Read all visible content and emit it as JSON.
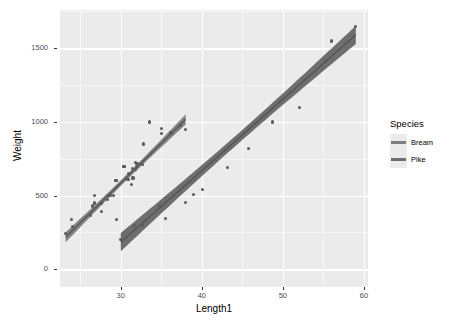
{
  "chart_data": {
    "type": "scatter",
    "title": "",
    "xlabel": "Length1",
    "ylabel": "Weight",
    "xlim": [
      22.5,
      60.5
    ],
    "ylim": [
      -120,
      1760
    ],
    "xticks": [
      30,
      40,
      50,
      60
    ],
    "yticks": [
      0,
      500,
      1000,
      1500
    ],
    "xticklabels": [
      "30",
      "40",
      "50",
      "60"
    ],
    "yticklabels": [
      "0",
      "500",
      "1000",
      "1500"
    ],
    "grid": true,
    "grid_color": "#ffffff",
    "panel_background": "#ebebeb",
    "legend": {
      "title": "Species",
      "position": "right",
      "entries": [
        {
          "label": "Bream",
          "color": "#7f7f7f"
        },
        {
          "label": "Pike",
          "color": "#6e6e6e"
        }
      ]
    },
    "series": [
      {
        "name": "Bream",
        "color": "#595959",
        "band_color": "#808080",
        "line_color": "#4d4d4d",
        "fit": {
          "intercept": -1035,
          "slope": 54.0,
          "x_start": 23.2,
          "x_end": 38.0
        },
        "points": [
          {
            "x": 23.2,
            "y": 242
          },
          {
            "x": 24.0,
            "y": 290
          },
          {
            "x": 23.9,
            "y": 340
          },
          {
            "x": 26.3,
            "y": 363
          },
          {
            "x": 26.5,
            "y": 430
          },
          {
            "x": 26.8,
            "y": 450
          },
          {
            "x": 26.8,
            "y": 500
          },
          {
            "x": 27.6,
            "y": 390
          },
          {
            "x": 27.6,
            "y": 450
          },
          {
            "x": 28.5,
            "y": 500
          },
          {
            "x": 28.4,
            "y": 475
          },
          {
            "x": 28.7,
            "y": 500
          },
          {
            "x": 29.1,
            "y": 500
          },
          {
            "x": 29.5,
            "y": 340
          },
          {
            "x": 29.4,
            "y": 600
          },
          {
            "x": 29.4,
            "y": 600
          },
          {
            "x": 30.4,
            "y": 700
          },
          {
            "x": 30.4,
            "y": 700
          },
          {
            "x": 30.9,
            "y": 610
          },
          {
            "x": 31.0,
            "y": 650
          },
          {
            "x": 31.3,
            "y": 575
          },
          {
            "x": 31.4,
            "y": 685
          },
          {
            "x": 31.5,
            "y": 620
          },
          {
            "x": 31.8,
            "y": 680
          },
          {
            "x": 31.9,
            "y": 700
          },
          {
            "x": 31.8,
            "y": 725
          },
          {
            "x": 32.0,
            "y": 720
          },
          {
            "x": 32.7,
            "y": 714
          },
          {
            "x": 32.8,
            "y": 850
          },
          {
            "x": 33.5,
            "y": 1000
          },
          {
            "x": 35.0,
            "y": 920
          },
          {
            "x": 35.0,
            "y": 955
          },
          {
            "x": 36.2,
            "y": 925
          },
          {
            "x": 37.4,
            "y": 975
          },
          {
            "x": 38.0,
            "y": 950
          }
        ]
      },
      {
        "name": "Pike",
        "color": "#595959",
        "band_color": "#6e6e6e",
        "line_color": "#4d4d4d",
        "fit": {
          "intercept": -1270,
          "slope": 48.5,
          "x_start": 30.0,
          "x_end": 59.0
        },
        "points": [
          {
            "x": 30.0,
            "y": 200
          },
          {
            "x": 31.7,
            "y": 300
          },
          {
            "x": 32.7,
            "y": 300
          },
          {
            "x": 34.8,
            "y": 430
          },
          {
            "x": 35.5,
            "y": 345
          },
          {
            "x": 38.0,
            "y": 456
          },
          {
            "x": 39.0,
            "y": 510
          },
          {
            "x": 40.1,
            "y": 540
          },
          {
            "x": 43.2,
            "y": 690
          },
          {
            "x": 45.8,
            "y": 820
          },
          {
            "x": 48.7,
            "y": 1000
          },
          {
            "x": 52.0,
            "y": 1100
          },
          {
            "x": 56.0,
            "y": 1550
          },
          {
            "x": 59.0,
            "y": 1650
          }
        ]
      }
    ]
  }
}
